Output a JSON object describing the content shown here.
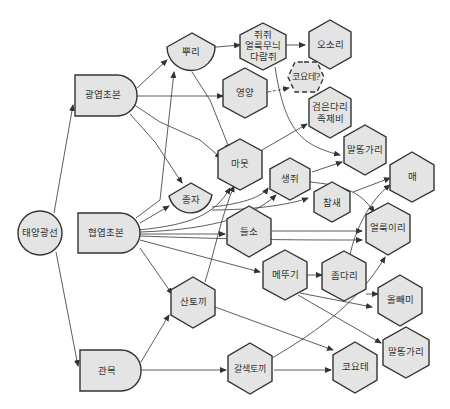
{
  "diagram": {
    "type": "food-web",
    "background": "#ffffff",
    "node_fill": "#e4e4e4",
    "stroke_color": "#333333",
    "nodes": {
      "sun": {
        "label": "태양광선",
        "shape": "circle"
      },
      "broadleaf": {
        "label": "광엽초본",
        "shape": "d-shape"
      },
      "grass": {
        "label": "협엽초본",
        "shape": "d-shape"
      },
      "shrub": {
        "label": "관목",
        "shape": "d-shape"
      },
      "root": {
        "label": "뿌리",
        "shape": "fan"
      },
      "seed": {
        "label": "종자",
        "shape": "fan"
      },
      "rodent_l1": {
        "label": "쥐쥐",
        "shape": "hexagon"
      },
      "rodent_l2": {
        "label": "얼룩무늬",
        "shape": "hexagon"
      },
      "rodent_l3": {
        "label": "다람쥐",
        "shape": "hexagon"
      },
      "badger": {
        "label": "오소리",
        "shape": "hexagon"
      },
      "coyote_q": {
        "label": "코요테?",
        "shape": "hexagon-dashed"
      },
      "pronghorn": {
        "label": "영양",
        "shape": "hexagon"
      },
      "ferret_l1": {
        "label": "검은다리",
        "shape": "hexagon"
      },
      "ferret_l2": {
        "label": "족제비",
        "shape": "hexagon"
      },
      "hawk1": {
        "label": "말똥가리",
        "shape": "hexagon"
      },
      "marmot": {
        "label": "마못",
        "shape": "hexagon"
      },
      "mouse": {
        "label": "생쥐",
        "shape": "hexagon"
      },
      "falcon": {
        "label": "매",
        "shape": "hexagon"
      },
      "sparrow": {
        "label": "참새",
        "shape": "hexagon"
      },
      "bison": {
        "label": "들소",
        "shape": "hexagon"
      },
      "spottedwolf": {
        "label": "얼룩이리",
        "shape": "hexagon"
      },
      "grasshopper": {
        "label": "메뚜기",
        "shape": "hexagon"
      },
      "shrew": {
        "label": "좀다리",
        "shape": "hexagon"
      },
      "hare": {
        "label": "산토끼",
        "shape": "hexagon"
      },
      "owl": {
        "label": "올빼미",
        "shape": "hexagon"
      },
      "hawk2": {
        "label": "말똥가리",
        "shape": "hexagon"
      },
      "brownhare": {
        "label": "갈색토끼",
        "shape": "hexagon"
      },
      "coyote": {
        "label": "코요테",
        "shape": "hexagon"
      }
    },
    "edges": [
      [
        "태양광선",
        "광엽초본"
      ],
      [
        "태양광선",
        "협엽초본"
      ],
      [
        "태양광선",
        "관목"
      ],
      [
        "광엽초본",
        "뿌리"
      ],
      [
        "광엽초본",
        "영양"
      ],
      [
        "광엽초본",
        "마못"
      ],
      [
        "광엽초본",
        "종자"
      ],
      [
        "협엽초본",
        "뿌리"
      ],
      [
        "협엽초본",
        "종자"
      ],
      [
        "협엽초본",
        "마못"
      ],
      [
        "협엽초본",
        "생쥐"
      ],
      [
        "협엽초본",
        "들소"
      ],
      [
        "협엽초본",
        "메뚜기"
      ],
      [
        "협엽초본",
        "산토끼"
      ],
      [
        "협엽초본",
        "얼룩이리"
      ],
      [
        "관목",
        "산토끼"
      ],
      [
        "관목",
        "갈색토끼"
      ],
      [
        "뿌리",
        "쥐쥐 얼룩무늬 다람쥐"
      ],
      [
        "뿌리",
        "마못"
      ],
      [
        "쥐쥐 얼룩무늬 다람쥐",
        "오소리"
      ],
      [
        "쥐쥐 얼룩무늬 다람쥐",
        "말똥가리"
      ],
      [
        "영양",
        "코요테?"
      ],
      [
        "마못",
        "검은다리 족제비"
      ],
      [
        "종자",
        "생쥐"
      ],
      [
        "종자",
        "참새"
      ],
      [
        "생쥐",
        "말똥가리"
      ],
      [
        "생쥐",
        "매"
      ],
      [
        "생쥐",
        "얼룩이리"
      ],
      [
        "참새",
        "매"
      ],
      [
        "들소",
        "얼룩이리"
      ],
      [
        "메뚜기",
        "좀다리"
      ],
      [
        "메뚜기",
        "올빼미"
      ],
      [
        "메뚜기",
        "말똥가리"
      ],
      [
        "좀다리",
        "올빼미"
      ],
      [
        "좀다리",
        "매"
      ],
      [
        "산토끼",
        "코요테"
      ],
      [
        "산토끼",
        "마못"
      ],
      [
        "갈색토끼",
        "코요테"
      ],
      [
        "갈색토끼",
        "얼룩이리"
      ]
    ]
  }
}
